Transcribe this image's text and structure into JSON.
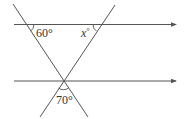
{
  "diagram": {
    "type": "geometry-parallel-lines-transversals",
    "colors": {
      "line": "#555555",
      "text": "#333333",
      "background": "#ffffff"
    },
    "lines": {
      "top_parallel": {
        "x1": 14,
        "y1": 24.5,
        "x2": 176,
        "y2": 24.5,
        "arrow": true
      },
      "bottom_parallel": {
        "x1": 14,
        "y1": 81,
        "x2": 176,
        "y2": 81,
        "arrow": true
      },
      "left_transversal": {
        "x1": 13,
        "y1": 4,
        "x2": 88,
        "y2": 117
      },
      "right_transversal": {
        "x1": 115,
        "y1": 5,
        "x2": 40,
        "y2": 117
      }
    },
    "angles": {
      "top_left": {
        "label": "60°"
      },
      "top_right": {
        "label_var": "x",
        "label_deg": "°"
      },
      "bottom": {
        "label": "70°"
      }
    }
  }
}
